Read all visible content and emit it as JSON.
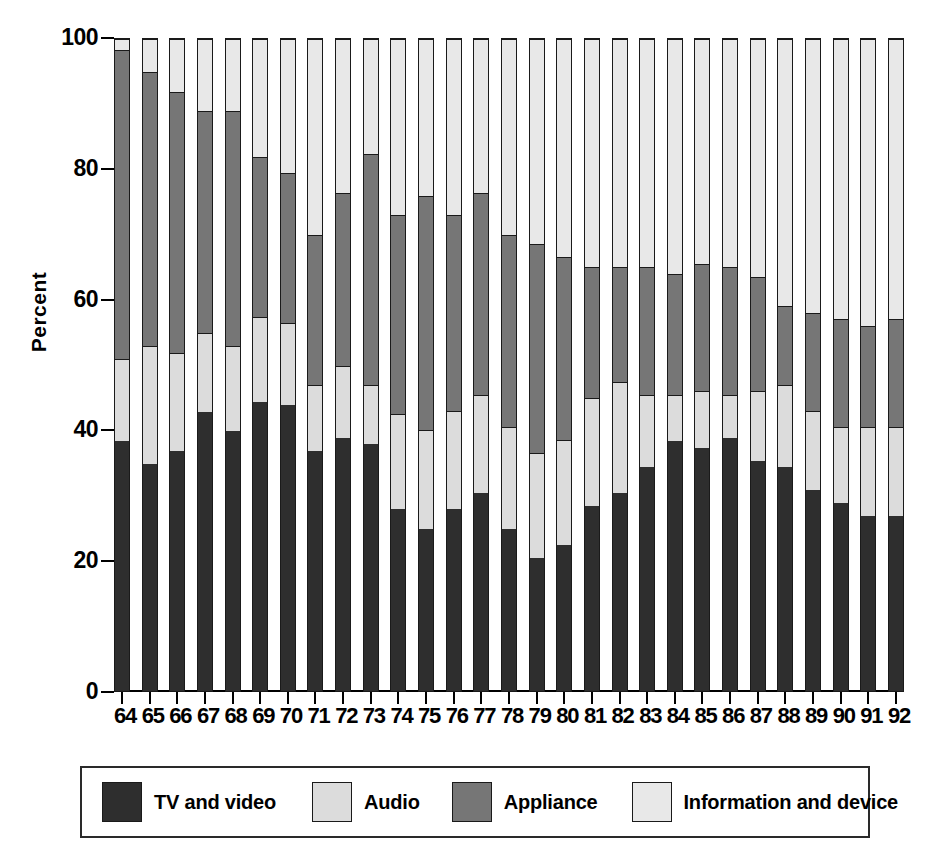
{
  "chart_data": {
    "type": "bar",
    "subtype": "stacked-100-percent",
    "title": "",
    "subtitle": "",
    "xlabel": "",
    "ylabel": "Percent",
    "ylim": [
      0,
      100
    ],
    "yticks": [
      0,
      20,
      40,
      60,
      80,
      100
    ],
    "ytick_labels": [
      "0",
      "20",
      "40",
      "60",
      "80",
      "100"
    ],
    "grid": false,
    "legend_position": "bottom",
    "categories": [
      "64",
      "65",
      "66",
      "67",
      "68",
      "69",
      "70",
      "71",
      "72",
      "73",
      "74",
      "75",
      "76",
      "77",
      "78",
      "79",
      "80",
      "81",
      "82",
      "83",
      "84",
      "85",
      "86",
      "87",
      "88",
      "89",
      "90",
      "91",
      "92"
    ],
    "series": [
      {
        "name": "TV and video",
        "color": "#2e2e2e",
        "values": [
          38.5,
          35.0,
          37.0,
          43.0,
          40.0,
          44.5,
          44.0,
          37.0,
          39.0,
          38.0,
          28.0,
          25.0,
          28.0,
          30.5,
          25.0,
          20.5,
          22.5,
          28.5,
          30.5,
          34.5,
          38.5,
          37.5,
          39.0,
          35.5,
          34.5,
          31.0,
          29.0,
          27.0,
          27.0
        ]
      },
      {
        "name": "Audio",
        "color": "#dcdcdc",
        "values": [
          12.5,
          18.0,
          15.0,
          12.0,
          13.0,
          13.0,
          12.5,
          10.0,
          11.0,
          9.0,
          14.5,
          15.0,
          15.0,
          15.0,
          15.5,
          16.0,
          16.0,
          16.5,
          17.0,
          11.0,
          7.0,
          8.5,
          6.5,
          10.5,
          12.5,
          12.0,
          11.5,
          13.5,
          13.5
        ]
      },
      {
        "name": "Appliance",
        "color": "#767676",
        "values": [
          47.5,
          42.0,
          40.0,
          34.0,
          36.0,
          24.5,
          23.0,
          23.0,
          26.5,
          35.5,
          30.5,
          36.0,
          30.0,
          31.0,
          29.5,
          32.0,
          28.0,
          20.0,
          17.5,
          19.5,
          18.5,
          19.5,
          19.5,
          17.5,
          12.0,
          15.0,
          16.5,
          15.5,
          16.5
        ]
      },
      {
        "name": "Information and device",
        "color": "#e8e8e8",
        "values": [
          1.5,
          5.0,
          8.0,
          11.0,
          11.0,
          18.0,
          20.5,
          30.0,
          23.5,
          17.5,
          27.0,
          24.0,
          27.0,
          23.5,
          30.0,
          31.5,
          33.5,
          35.0,
          35.0,
          35.0,
          36.0,
          34.5,
          35.0,
          36.5,
          41.0,
          42.0,
          43.0,
          44.0,
          43.0
        ]
      }
    ]
  },
  "axis": {
    "ylabel": "Percent",
    "ytick_labels": [
      "100",
      "80",
      "60",
      "40",
      "20",
      "0"
    ]
  },
  "legend": {
    "items": [
      {
        "label": "TV and video",
        "color": "#2e2e2e"
      },
      {
        "label": "Audio",
        "color": "#dcdcdc"
      },
      {
        "label": "Appliance",
        "color": "#767676"
      },
      {
        "label": "Information and device",
        "color": "#e8e8e8"
      }
    ]
  }
}
